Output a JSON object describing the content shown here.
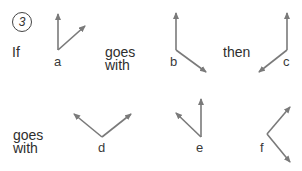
{
  "puzzle": {
    "number": "3",
    "words": {
      "if": "If",
      "goes_with_1_line1": "goes",
      "goes_with_1_line2": "with",
      "then": "then",
      "goes_with_2_line1": "goes",
      "goes_with_2_line2": "with"
    },
    "figures": [
      {
        "label": "a"
      },
      {
        "label": "b"
      },
      {
        "label": "c"
      },
      {
        "label": "d"
      },
      {
        "label": "e"
      },
      {
        "label": "f"
      }
    ],
    "arrow_color": "#7a7a7a"
  }
}
